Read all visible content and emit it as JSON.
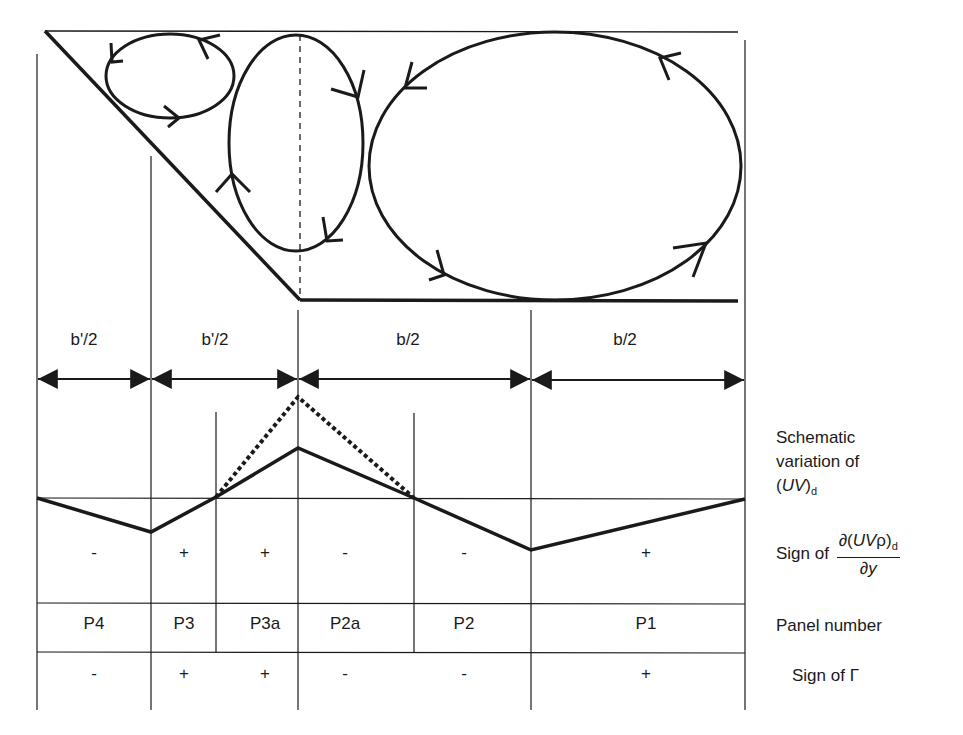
{
  "diagram": {
    "type": "schematic",
    "vortices": [
      {
        "name": "small-vortex",
        "cx": 170,
        "cy": 73,
        "rx": 64,
        "ry": 40,
        "direction": "counterclockwise"
      },
      {
        "name": "middle-vortex",
        "cx": 296,
        "cy": 142,
        "rx": 67,
        "ry": 108,
        "direction": "clockwise"
      },
      {
        "name": "large-vortex",
        "cx": 555,
        "cy": 165,
        "rx": 185,
        "ry": 133,
        "direction": "counterclockwise"
      }
    ],
    "spans": [
      {
        "label": "b'/2",
        "x1": 37,
        "x2": 151
      },
      {
        "label": "b'/2",
        "x1": 151,
        "x2": 298
      },
      {
        "label": "b/2",
        "x1": 298,
        "x2": 531
      },
      {
        "label": "b/2",
        "x1": 531,
        "x2": 745
      }
    ],
    "uv_solid_points": [
      [
        37,
        498
      ],
      [
        151,
        532
      ],
      [
        216,
        497
      ],
      [
        298,
        448
      ],
      [
        414,
        498
      ],
      [
        531,
        550
      ],
      [
        745,
        499
      ]
    ],
    "uv_dotted_points": [
      [
        216,
        497
      ],
      [
        298,
        397
      ],
      [
        414,
        498
      ]
    ]
  },
  "row_labels": {
    "schematic_line1": "Schematic",
    "schematic_line2": "variation of",
    "uv_open": "(",
    "uv_var": "UV",
    "uv_close": ")",
    "uv_sub": "d",
    "sign_of": "Sign of",
    "deriv_num_open": "∂(",
    "deriv_num_var": "UV",
    "deriv_num_rho": "ρ)",
    "deriv_num_sub": "d",
    "deriv_den": "∂y",
    "panel_number": "Panel number",
    "sign_of_gamma": "Sign of Γ"
  },
  "panels": [
    {
      "name": "P4",
      "x": 94,
      "derivative_sign": "-",
      "gamma_sign": "-"
    },
    {
      "name": "P3",
      "x": 184,
      "derivative_sign": "+",
      "gamma_sign": "+"
    },
    {
      "name": "P3a",
      "x": 265,
      "derivative_sign": "+",
      "gamma_sign": "+"
    },
    {
      "name": "P2a",
      "x": 345,
      "derivative_sign": "-",
      "gamma_sign": "-"
    },
    {
      "name": "P2",
      "x": 464,
      "derivative_sign": "-",
      "gamma_sign": "-"
    },
    {
      "name": "P1",
      "x": 646,
      "derivative_sign": "+",
      "gamma_sign": "+"
    }
  ]
}
